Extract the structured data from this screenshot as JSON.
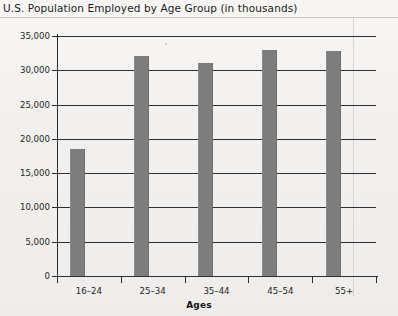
{
  "chart_data": {
    "type": "bar",
    "title": "U.S. Population Employed by Age Group (in thousands)",
    "xlabel": "Ages",
    "ylabel": "",
    "categories": [
      "16–24",
      "25–34",
      "35–44",
      "45–54",
      "55+"
    ],
    "values": [
      18500,
      32100,
      31000,
      32900,
      32800
    ],
    "ylim": [
      0,
      35000
    ],
    "ytick_values": [
      0,
      5000,
      10000,
      15000,
      20000,
      25000,
      30000,
      35000
    ],
    "ytick_labels": [
      "0",
      "5,000",
      "10,000",
      "15,000",
      "20,000",
      "25,000",
      "30,000",
      "35,000"
    ],
    "grid": true,
    "legend": null,
    "bar_color": "#7d7d7d",
    "axis_color": "#2b2b2b",
    "background_color": "#f3f2f0"
  }
}
